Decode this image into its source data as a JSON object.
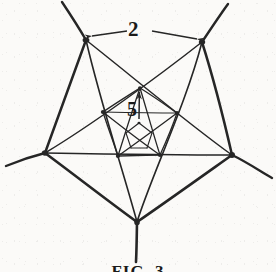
{
  "figure": {
    "kind": "hand-drawn-geometric-diagram",
    "background_color": "#fbfaf8",
    "ink_color": "#262626",
    "labels": [
      {
        "name": "outer-edge-dimension",
        "text": "2",
        "x": 138,
        "y": 30
      },
      {
        "name": "inner-arrow-dimension",
        "text": "5",
        "x": 137,
        "y": 110
      }
    ],
    "caption": {
      "text": "FIG. 3",
      "clipped": true
    },
    "outer_vertices": [
      {
        "name": "top-left",
        "x": 86,
        "y": 40
      },
      {
        "name": "top-right",
        "x": 202,
        "y": 42
      },
      {
        "name": "right",
        "x": 232,
        "y": 155
      },
      {
        "name": "bottom",
        "x": 137,
        "y": 222
      },
      {
        "name": "left",
        "x": 45,
        "y": 153
      }
    ],
    "outer_rays": [
      {
        "from": "top-left",
        "to_x": 62,
        "to_y": 2
      },
      {
        "from": "top-right",
        "to_x": 228,
        "to_y": 4
      },
      {
        "from": "right",
        "to_x": 272,
        "to_y": 178
      },
      {
        "from": "bottom",
        "to_x": 136,
        "to_y": 262
      },
      {
        "from": "left",
        "to_x": 6,
        "to_y": 166
      }
    ],
    "mid_vertices": [
      {
        "name": "mid-top",
        "x": 140,
        "y": 88
      },
      {
        "name": "mid-upper-right",
        "x": 177,
        "y": 113
      },
      {
        "name": "mid-lower-right",
        "x": 160,
        "y": 155
      },
      {
        "name": "mid-lower-left",
        "x": 118,
        "y": 156
      },
      {
        "name": "mid-upper-left",
        "x": 103,
        "y": 112
      }
    ],
    "inner_vertices": [
      {
        "name": "in-top",
        "x": 139,
        "y": 123
      },
      {
        "name": "in-upper-right",
        "x": 152,
        "y": 133
      },
      {
        "name": "in-lower-right",
        "x": 147,
        "y": 148
      },
      {
        "name": "in-lower-left",
        "x": 131,
        "y": 148
      },
      {
        "name": "in-upper-left",
        "x": 126,
        "y": 133
      }
    ],
    "dimension_2": {
      "name": "top-edge-dimension-line",
      "x1": 92,
      "y1": 36,
      "x2": 197,
      "y2": 39,
      "label": "2",
      "arrowheads": "both"
    },
    "dimension_5": {
      "name": "inner-pentagon-leader-arrow",
      "x1": 139,
      "y1": 119,
      "x2": 139,
      "y2": 90,
      "label": "5",
      "arrowheads": "start"
    }
  }
}
